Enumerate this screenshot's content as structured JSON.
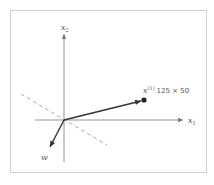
{
  "diagram": {
    "axes": {
      "x_label": "x",
      "x_subscript": "1",
      "y_label": "x",
      "y_subscript": "2"
    },
    "point": {
      "label": "x",
      "superscript": "(1)",
      "value_text": "125 × 50"
    },
    "weight_vector": {
      "label": "w"
    },
    "decision_boundary": "dashed line",
    "colors": {
      "axis": "#777777",
      "vector": "#333333",
      "dashed": "#aaaaaa",
      "frame": "#d2d2d2"
    }
  }
}
